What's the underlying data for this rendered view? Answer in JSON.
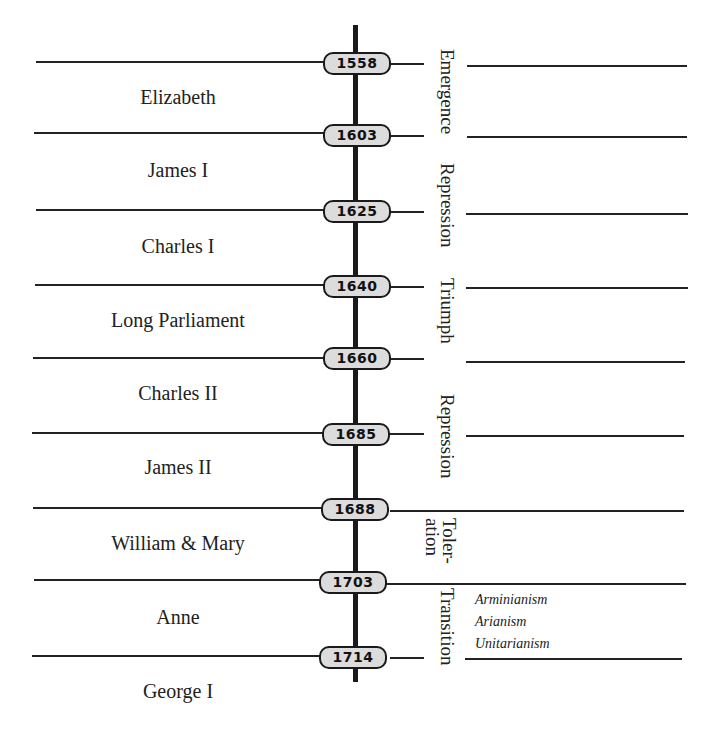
{
  "years": [
    "1558",
    "1603",
    "1625",
    "1640",
    "1660",
    "1685",
    "1688",
    "1703",
    "1714"
  ],
  "reigns": [
    "Elizabeth",
    "James I",
    "Charles I",
    "Long Parliament",
    "Charles II",
    "James II",
    "William & Mary",
    "Anne",
    "George I"
  ],
  "eras": {
    "emergence": "Emergence",
    "repression1": "Repression",
    "triumph": "Triumph",
    "repression2": "Repression",
    "toleration": "Toler-\nation",
    "transition": "Transition"
  },
  "transition_notes": [
    "Arminianism",
    "Arianism",
    "Unitarianism"
  ],
  "colors": {
    "line": "#222222",
    "pill_fill": "#dcdcdc",
    "spine": "#1a1a1a"
  }
}
